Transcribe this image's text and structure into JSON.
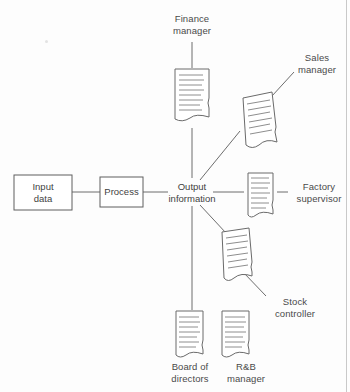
{
  "page": {
    "caption_fragment": "",
    "background": "#fdfdfd",
    "line_color": "#6d6d6d",
    "text_color": "#4a4a4a"
  },
  "diagram": {
    "title": "",
    "input_box": {
      "label": "Input\ndata"
    },
    "process_box": {
      "label": "Process"
    },
    "hub": {
      "label": "Output\ninformation"
    },
    "recipients": [
      {
        "id": "finance-manager",
        "label": "Finance\nmanager",
        "connector": "vertical-up"
      },
      {
        "id": "sales-manager",
        "label": "Sales\nmanager",
        "connector": "diagonal-up-right"
      },
      {
        "id": "factory-supervisor",
        "label": "Factory\nsupervisor",
        "connector": "horizontal-right"
      },
      {
        "id": "stock-controller",
        "label": "Stock\ncontroller",
        "connector": "diagonal-down-right"
      },
      {
        "id": "board-of-directors",
        "label": "Board of\ndirectors",
        "connector": "vertical-down"
      },
      {
        "id": "rb-manager",
        "label": "R&B\nmanager",
        "connector": "none"
      }
    ]
  }
}
